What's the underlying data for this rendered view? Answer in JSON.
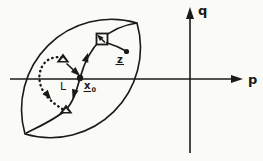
{
  "figure": {
    "background_color": "#fafaf7",
    "ink_color": "#1a1a1a",
    "axes": {
      "horizontal": {
        "label": "p"
      },
      "vertical": {
        "label": "q"
      }
    },
    "annotations": {
      "loop_label": "L",
      "start_point_base": "x",
      "start_point_subscript": "0",
      "step_point_label": "z"
    },
    "markers": {
      "start_point": "filled-dot-marker",
      "step_point": "filled-dot-marker",
      "square_point": "open-square-marker",
      "triangle_points": "filled-triangle-markers",
      "region_outline": "lens-shaped-region",
      "loop_path": "dotted-loop-curve",
      "trajectory": "solid-trajectory-curve"
    }
  }
}
